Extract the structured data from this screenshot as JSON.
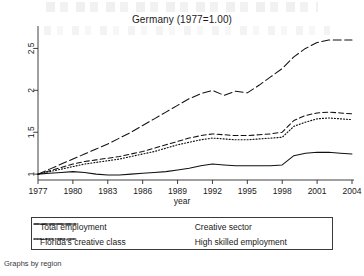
{
  "figure": {
    "title": "Germany (1977=1.00)",
    "caption": "Graphs by region"
  },
  "axes": {
    "xlabel": "year",
    "xticks": [
      "1977",
      "1980",
      "1983",
      "1986",
      "1989",
      "1992",
      "1995",
      "1998",
      "2001",
      "2004"
    ],
    "yticks": [
      "1",
      "1.5",
      "2",
      "2.5"
    ]
  },
  "legend": {
    "entries": [
      {
        "label": "Total employment",
        "style": "solid"
      },
      {
        "label": "Creative sector",
        "style": "dashed"
      },
      {
        "label": "Florida's creative class",
        "style": "dotted"
      },
      {
        "label": "High skilled employment",
        "style": "longdashdot"
      }
    ]
  },
  "chart_data": {
    "type": "line",
    "title": "Germany (1977=1.00)",
    "xlabel": "year",
    "ylabel": "",
    "xlim": [
      1977,
      2004
    ],
    "ylim": [
      0.93,
      2.72
    ],
    "grid": false,
    "legend_position": "bottom",
    "note": "Index, 1977 = 1.00",
    "x": [
      1977,
      1978,
      1979,
      1980,
      1981,
      1982,
      1983,
      1984,
      1985,
      1986,
      1987,
      1988,
      1989,
      1990,
      1991,
      1992,
      1993,
      1994,
      1995,
      1996,
      1997,
      1998,
      1999,
      2000,
      2001,
      2002,
      2003,
      2004
    ],
    "series": [
      {
        "name": "Total employment",
        "style": "solid",
        "values": [
          1.0,
          1.01,
          1.02,
          1.03,
          1.02,
          1.0,
          0.99,
          0.99,
          1.0,
          1.01,
          1.02,
          1.03,
          1.05,
          1.07,
          1.1,
          1.12,
          1.11,
          1.1,
          1.1,
          1.1,
          1.1,
          1.11,
          1.22,
          1.25,
          1.26,
          1.26,
          1.25,
          1.24
        ]
      },
      {
        "name": "Creative sector",
        "style": "dashed",
        "values": [
          1.0,
          1.04,
          1.08,
          1.12,
          1.15,
          1.17,
          1.19,
          1.21,
          1.24,
          1.27,
          1.31,
          1.35,
          1.39,
          1.43,
          1.46,
          1.48,
          1.47,
          1.46,
          1.46,
          1.47,
          1.48,
          1.5,
          1.64,
          1.7,
          1.73,
          1.74,
          1.73,
          1.72
        ]
      },
      {
        "name": "Florida's creative class",
        "style": "dotted",
        "values": [
          1.0,
          1.03,
          1.06,
          1.09,
          1.12,
          1.14,
          1.16,
          1.18,
          1.21,
          1.24,
          1.27,
          1.31,
          1.35,
          1.38,
          1.41,
          1.43,
          1.42,
          1.41,
          1.41,
          1.42,
          1.43,
          1.44,
          1.57,
          1.62,
          1.66,
          1.67,
          1.66,
          1.65
        ]
      },
      {
        "name": "High skilled employment",
        "style": "longdashdot",
        "values": [
          1.0,
          1.06,
          1.12,
          1.18,
          1.24,
          1.3,
          1.36,
          1.43,
          1.5,
          1.58,
          1.66,
          1.74,
          1.82,
          1.9,
          1.96,
          2.0,
          1.94,
          1.99,
          1.97,
          2.06,
          2.16,
          2.26,
          2.4,
          2.5,
          2.57,
          2.6,
          2.6,
          2.6
        ]
      }
    ]
  },
  "colors": {
    "ink": "#111111",
    "axis": "#2b2b2b",
    "background": "#ffffff"
  }
}
